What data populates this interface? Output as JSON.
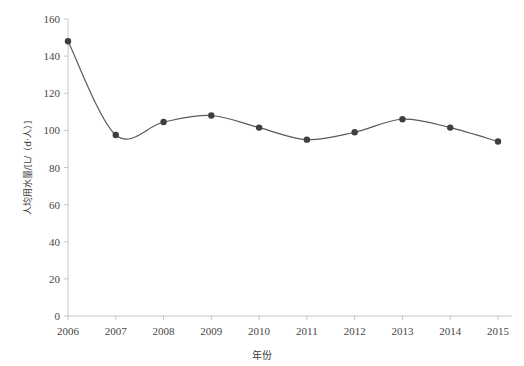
{
  "chart_data": {
    "type": "line",
    "title": "",
    "subtitle": "",
    "xlabel": "年份",
    "ylabel": "人均用水量/[L/（d·人）]",
    "categories": [
      "2006",
      "2007",
      "2008",
      "2009",
      "2010",
      "2011",
      "2012",
      "2013",
      "2014",
      "2015"
    ],
    "x": [
      2006,
      2007,
      2008,
      2009,
      2010,
      2011,
      2012,
      2013,
      2014,
      2015
    ],
    "values": [
      148,
      97.5,
      104.5,
      108,
      101.5,
      95,
      99,
      106,
      101.5,
      94
    ],
    "series": [
      {
        "name": "人均用水量",
        "values": [
          148,
          97.5,
          104.5,
          108,
          101.5,
          95,
          99,
          106,
          101.5,
          94
        ]
      }
    ],
    "ylim": [
      0,
      160
    ],
    "xlim": [
      2006,
      2015
    ],
    "yticks": [
      0,
      20,
      40,
      60,
      80,
      100,
      120,
      140,
      160
    ],
    "ytick_labels": [
      "0",
      "20",
      "40",
      "60",
      "80",
      "100",
      "120",
      "140",
      "160"
    ],
    "xtick_labels": [
      "2006",
      "2007",
      "2008",
      "2009",
      "2010",
      "2011",
      "2012",
      "2013",
      "2014",
      "2015"
    ],
    "grid": false,
    "legend": false,
    "legend_position": "none",
    "smoothing": "spline",
    "marker": "circle",
    "line_color": "#595959",
    "marker_color": "#3f3f3f",
    "axis_color": "#bfbfbf",
    "annotations": []
  },
  "axes": {
    "y_title": "人均用水量/[L/（d·人）]",
    "x_title": "年份"
  },
  "ghost": {
    "top_strip": "　　　　　　　　　　　　　　　　　　　　　　　　　"
  }
}
